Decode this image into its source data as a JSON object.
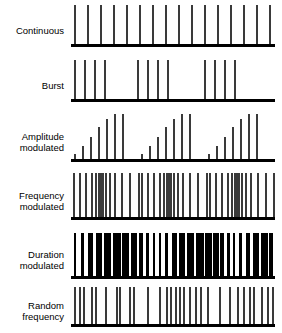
{
  "figure": {
    "title": "",
    "background_color": "#ffffff",
    "pulse_color": "#3a3a3a",
    "solid_pulse_color": "#000000",
    "baseline_color": "#000000"
  },
  "rows": [
    {
      "label": "Continuous",
      "name": "continuous",
      "label_lines": 1,
      "baseline_y": 47,
      "trace_height": 42,
      "description": "Evenly spaced pulses of uniform height across the entire trace"
    },
    {
      "label": "Burst",
      "name": "burst",
      "label_lines": 1,
      "baseline_y": 102,
      "trace_height": 42,
      "description": "Three groups of four uniform pulses separated by silent gaps"
    },
    {
      "label": "Amplitude\nmodulated",
      "name": "amplitude-modulated",
      "label_lines": 2,
      "baseline_y": 162,
      "trace_height": 48,
      "description": "Three ramped groups, pulse amplitude increases within each group"
    },
    {
      "label": "Frequency\nmodulated",
      "name": "frequency-modulated",
      "label_lines": 2,
      "baseline_y": 220,
      "trace_height": 47,
      "description": "Uniform amplitude pulses whose spacing compresses and expands cyclically"
    },
    {
      "label": "Duration\nmodulated",
      "name": "duration-modulated",
      "label_lines": 2,
      "baseline_y": 279,
      "trace_height": 46,
      "description": "Bars of uniform height with cyclically varying widths"
    },
    {
      "label": "Random\nfrequency",
      "name": "random-frequency",
      "label_lines": 2,
      "baseline_y": 327,
      "trace_height": 40,
      "description": "Uniform amplitude pulses at irregular random intervals"
    }
  ],
  "chart_data": {
    "type": "line",
    "xlabel": "Time",
    "ylabel": "Amplitude",
    "xlim": [
      0,
      204
    ],
    "ylim": [
      0,
      1
    ],
    "grid": false,
    "legend": "none",
    "series": [
      {
        "name": "Continuous",
        "pulse_width": 1.6,
        "x": [
          3,
          16,
          29,
          42,
          55,
          68,
          81,
          94,
          107,
          120,
          133,
          146,
          159,
          172,
          185,
          198
        ],
        "amplitude": [
          1,
          1,
          1,
          1,
          1,
          1,
          1,
          1,
          1,
          1,
          1,
          1,
          1,
          1,
          1,
          1
        ]
      },
      {
        "name": "Burst",
        "pulse_width": 1.6,
        "x": [
          3,
          13,
          23,
          33,
          66,
          76,
          86,
          96,
          133,
          143,
          153,
          163
        ],
        "amplitude": [
          1,
          1,
          1,
          1,
          1,
          1,
          1,
          1,
          1,
          1,
          1,
          1
        ]
      },
      {
        "name": "Amplitude modulated",
        "pulse_width": 1.8,
        "x": [
          3,
          11,
          19,
          27,
          35,
          43,
          51,
          70,
          78,
          86,
          94,
          102,
          110,
          118,
          137,
          145,
          153,
          161,
          169,
          177,
          185
        ],
        "amplitude": [
          0.12,
          0.3,
          0.5,
          0.72,
          0.9,
          1.0,
          1.0,
          0.12,
          0.3,
          0.5,
          0.72,
          0.9,
          1.0,
          1.0,
          0.12,
          0.3,
          0.5,
          0.72,
          0.9,
          1.0,
          1.0
        ]
      },
      {
        "name": "Frequency modulated",
        "pulse_width": 1.6,
        "x": [
          2,
          8,
          14,
          20,
          24,
          27,
          29,
          31,
          34,
          38,
          43,
          50,
          58,
          67,
          70,
          76,
          82,
          88,
          92,
          95,
          97,
          99,
          102,
          106,
          111,
          118,
          126,
          135,
          138,
          144,
          150,
          156,
          160,
          163,
          165,
          167,
          170,
          174,
          179,
          186,
          194,
          202
        ],
        "amplitude": [
          1,
          1,
          1,
          1,
          1,
          1,
          1,
          1,
          1,
          1,
          1,
          1,
          1,
          1,
          1,
          1,
          1,
          1,
          1,
          1,
          1,
          1,
          1,
          1,
          1,
          1,
          1,
          1,
          1,
          1,
          1,
          1,
          1,
          1,
          1,
          1,
          1,
          1,
          1,
          1,
          1,
          1
        ]
      },
      {
        "name": "Duration modulated",
        "x": [
          3,
          10,
          17,
          25,
          33,
          42,
          51,
          60,
          68,
          75,
          82,
          88,
          94,
          101,
          108,
          116,
          125,
          134,
          142,
          149,
          156,
          162,
          168,
          175,
          182,
          190,
          198
        ],
        "widths": [
          1.8,
          3.0,
          4.5,
          6.0,
          7.0,
          7.5,
          7.0,
          5.5,
          4.0,
          2.6,
          1.8,
          1.8,
          3.0,
          4.5,
          6.0,
          7.0,
          7.5,
          7.0,
          5.5,
          4.0,
          2.6,
          1.8,
          2.6,
          4.0,
          5.5,
          6.5,
          4.0
        ],
        "amplitude": [
          1,
          1,
          1,
          1,
          1,
          1,
          1,
          1,
          1,
          1,
          1,
          1,
          1,
          1,
          1,
          1,
          1,
          1,
          1,
          1,
          1,
          1,
          1,
          1,
          1,
          1,
          1
        ]
      },
      {
        "name": "Random frequency",
        "pulse_width": 1.6,
        "x": [
          3,
          8,
          12,
          20,
          24,
          34,
          45,
          48,
          58,
          62,
          76,
          88,
          95,
          99,
          104,
          108,
          112,
          118,
          124,
          129,
          136,
          148,
          158,
          166,
          172,
          178,
          182,
          190,
          196,
          201
        ],
        "amplitude": [
          1,
          1,
          1,
          1,
          1,
          1,
          1,
          1,
          1,
          1,
          1,
          1,
          1,
          1,
          1,
          1,
          1,
          1,
          1,
          1,
          1,
          1,
          1,
          1,
          1,
          1,
          1,
          1,
          1,
          1
        ]
      }
    ]
  }
}
